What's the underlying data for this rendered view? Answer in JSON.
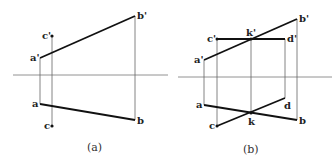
{
  "figure_a": {
    "caption": "(a)",
    "labels": {
      "a_prime": "a'",
      "b_prime": "b'",
      "c_prime": "c'",
      "a": "a",
      "b": "b",
      "c": "c"
    }
  },
  "figure_b": {
    "caption": "(b)",
    "labels": {
      "a_prime": "a'",
      "b_prime": "b'",
      "c_prime": "c'",
      "d_prime": "d'",
      "k_prime": "k'",
      "a": "a",
      "b": "b",
      "c": "c",
      "d": "d",
      "k": "k"
    }
  },
  "colors": {
    "thick_line": "#111111",
    "thin_line": "#666666",
    "axis": "#777777"
  }
}
